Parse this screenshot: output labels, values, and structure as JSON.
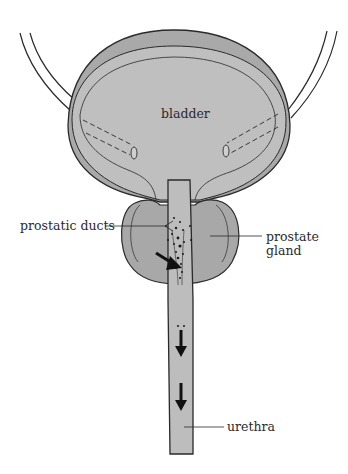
{
  "diagram": {
    "labels": {
      "bladder": "bladder",
      "prostatic_ducts": "prostatic ducts",
      "prostate_gland_line1": "prostate",
      "prostate_gland_line2": "gland",
      "urethra": "urethra"
    },
    "colors": {
      "outer_wall": "#a9a9a9",
      "fill": "#bdbdbd",
      "prostate": "#a8a8a8",
      "outline": "#2a2a2a",
      "ureter_fill": "#ffffff"
    }
  }
}
